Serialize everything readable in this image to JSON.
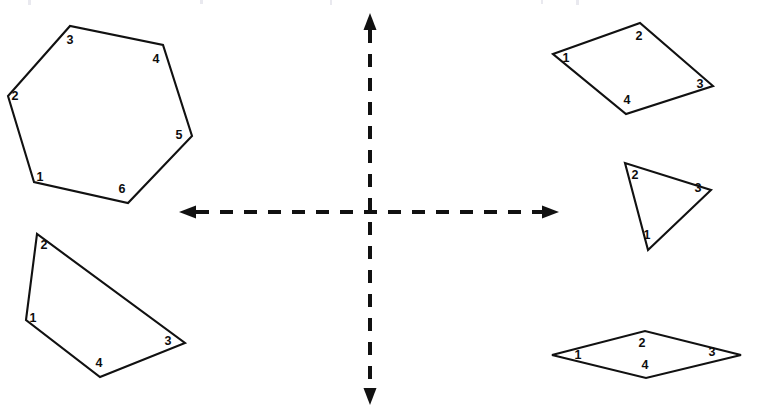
{
  "diagram": {
    "background_color": "#ffffff",
    "stroke_color": "#111111",
    "label_color": "#0d0d0d",
    "width": 758,
    "height": 417
  },
  "axes": {
    "name": "dashed-coordinate-axes",
    "origin": {
      "x": 370,
      "y": 212
    },
    "style": "dashed",
    "color": "#111111",
    "horizontal": {
      "name": "x-axis",
      "y": 212,
      "x_start": 196,
      "x_end": 542,
      "arrow_left": true,
      "arrow_right": true
    },
    "vertical": {
      "name": "y-axis",
      "x": 370,
      "y_start": 30,
      "y_end": 388,
      "arrow_up": true,
      "arrow_down": true
    }
  },
  "shapes": [
    {
      "name": "hexagon-upper-left",
      "sides": 6,
      "quadrant": "upper-left",
      "points": "34,182 8,96 70,26 163,45 192,136 128,203",
      "vertices": [
        {
          "label": "1",
          "x": 34,
          "y": 182,
          "lx": 40,
          "ly": 178
        },
        {
          "label": "2",
          "x": 8,
          "y": 96,
          "lx": 15,
          "ly": 97
        },
        {
          "label": "3",
          "x": 70,
          "y": 26,
          "lx": 70,
          "ly": 41
        },
        {
          "label": "4",
          "x": 163,
          "y": 45,
          "lx": 156,
          "ly": 60
        },
        {
          "label": "5",
          "x": 192,
          "y": 136,
          "lx": 179,
          "ly": 136
        },
        {
          "label": "6",
          "x": 128,
          "y": 203,
          "lx": 122,
          "ly": 190
        }
      ]
    },
    {
      "name": "quadrilateral-lower-left",
      "sides": 4,
      "quadrant": "lower-left",
      "points": "26,320 37,234 185,343 100,377",
      "vertices": [
        {
          "label": "1",
          "x": 26,
          "y": 320,
          "lx": 33,
          "ly": 319
        },
        {
          "label": "2",
          "x": 37,
          "y": 234,
          "lx": 44,
          "ly": 246
        },
        {
          "label": "3",
          "x": 185,
          "y": 343,
          "lx": 168,
          "ly": 342
        },
        {
          "label": "4",
          "x": 100,
          "y": 377,
          "lx": 99,
          "ly": 364
        }
      ]
    },
    {
      "name": "parallelogram-upper-right",
      "sides": 4,
      "quadrant": "upper-right",
      "points": "553,54 640,23 713,86 626,114",
      "vertices": [
        {
          "label": "1",
          "x": 553,
          "y": 54,
          "lx": 566,
          "ly": 59
        },
        {
          "label": "2",
          "x": 640,
          "y": 23,
          "lx": 639,
          "ly": 37
        },
        {
          "label": "3",
          "x": 713,
          "y": 86,
          "lx": 700,
          "ly": 85
        },
        {
          "label": "4",
          "x": 626,
          "y": 114,
          "lx": 627,
          "ly": 101
        }
      ]
    },
    {
      "name": "triangle-middle-right",
      "sides": 3,
      "quadrant": "right-middle",
      "points": "648,250 625,163 711,190",
      "vertices": [
        {
          "label": "1",
          "x": 648,
          "y": 250,
          "lx": 647,
          "ly": 236
        },
        {
          "label": "2",
          "x": 625,
          "y": 163,
          "lx": 635,
          "ly": 176
        },
        {
          "label": "3",
          "x": 711,
          "y": 190,
          "lx": 698,
          "ly": 189
        }
      ]
    },
    {
      "name": "rhombus-lower-right",
      "sides": 4,
      "quadrant": "lower-right",
      "points": "552,355 645,331 741,355 646,378",
      "vertices": [
        {
          "label": "1",
          "x": 552,
          "y": 355,
          "lx": 578,
          "ly": 356
        },
        {
          "label": "2",
          "x": 645,
          "y": 331,
          "lx": 642,
          "ly": 344
        },
        {
          "label": "3",
          "x": 741,
          "y": 355,
          "lx": 712,
          "ly": 353
        },
        {
          "label": "4",
          "x": 646,
          "y": 378,
          "lx": 645,
          "ly": 366
        }
      ]
    }
  ],
  "artifacts": {
    "name": "scan-specks",
    "description": "faint grey scanning marks along the top edge",
    "items": [
      {
        "x": 28,
        "y": 0,
        "w": 3,
        "h": 5
      },
      {
        "x": 200,
        "y": 0,
        "w": 3,
        "h": 4
      },
      {
        "x": 330,
        "y": 0,
        "w": 2,
        "h": 5
      },
      {
        "x": 541,
        "y": 0,
        "w": 2,
        "h": 4
      },
      {
        "x": 576,
        "y": 0,
        "w": 3,
        "h": 5
      }
    ]
  }
}
